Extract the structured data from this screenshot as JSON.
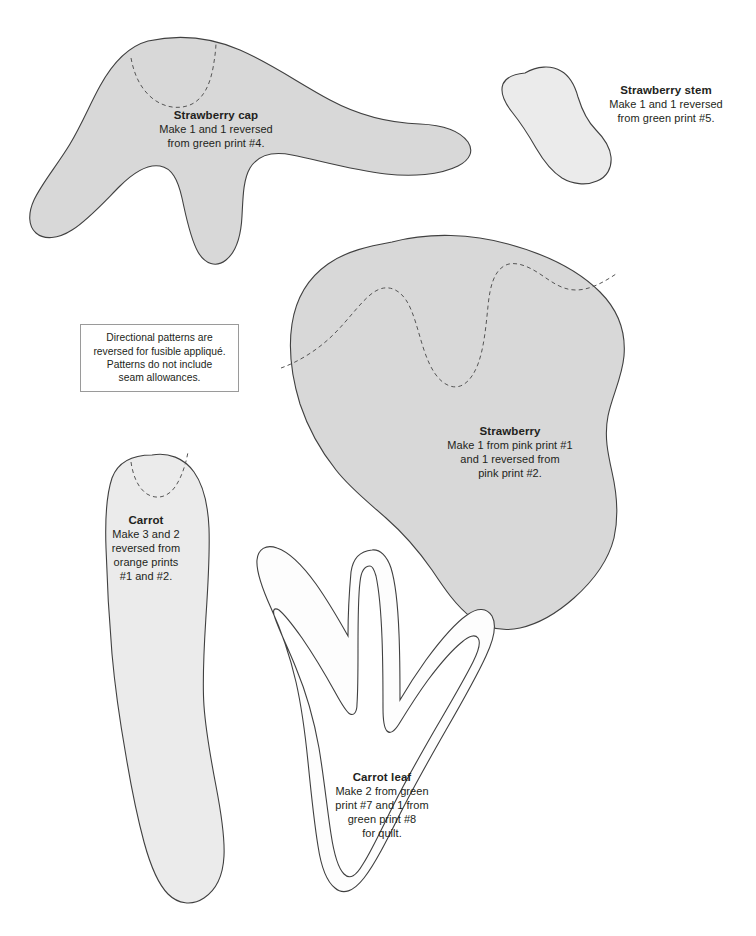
{
  "document": {
    "type": "appliqué pattern sheet",
    "background_color": "#ffffff",
    "piece_fill_gray": "#d8d8d8",
    "piece_fill_light": "#ebebeb",
    "piece_outline_color": "#404040",
    "guide_line_color": "#555555"
  },
  "note_box": {
    "lines": [
      "Directional patterns are",
      "reversed for fusible appliqué.",
      "Patterns do not include",
      "seam allowances."
    ]
  },
  "pieces": [
    {
      "id": "strawberry-cap",
      "title": "Strawberry cap",
      "lines": [
        "Make 1 and 1 reversed",
        "from green print #4."
      ],
      "fill": "gray"
    },
    {
      "id": "strawberry-stem",
      "title": "Strawberry stem",
      "lines": [
        "Make 1 and 1 reversed",
        "from green print #5."
      ],
      "fill": "light"
    },
    {
      "id": "strawberry",
      "title": "Strawberry",
      "lines": [
        "Make 1 from pink print #1",
        "and 1 reversed from",
        "pink print #2."
      ],
      "fill": "gray"
    },
    {
      "id": "carrot",
      "title": "Carrot",
      "lines": [
        "Make 3 and 2",
        "reversed from",
        "orange prints",
        "#1 and #2."
      ],
      "fill": "light"
    },
    {
      "id": "carrot-leaf",
      "title": "Carrot leaf",
      "lines": [
        "Make 2 from green",
        "print #7 and 1 from",
        "green print #8",
        "for quilt."
      ],
      "fill": "white"
    }
  ],
  "corner_mark": {
    "text": ""
  }
}
